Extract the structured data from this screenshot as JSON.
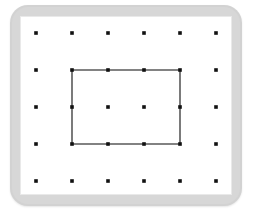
{
  "figure": {
    "name": "geoboard",
    "board": {
      "frame_color": "#d2d2d2",
      "surface_color": "#ffffff",
      "frame_corner_radius": 18,
      "frame_rect": {
        "x": 10,
        "y": 5,
        "width": 232,
        "height": 201
      },
      "surface_rect": {
        "x": 20,
        "y": 16,
        "width": 212,
        "height": 179
      }
    },
    "peg_grid": {
      "columns": 6,
      "rows": 5,
      "total_pegs": 30,
      "peg_color": "#111111",
      "peg_size": 3.6,
      "origin_x": 36,
      "origin_y": 33,
      "spacing_x": 36,
      "spacing_y": 37,
      "column_x": [
        36,
        72,
        108,
        144,
        180,
        216
      ],
      "row_y": [
        33,
        70,
        107,
        144,
        181
      ]
    },
    "shapes": [
      {
        "name": "rectangle",
        "type": "rectangle",
        "stroke_color": "#5a5a5a",
        "stroke_width": 1.6,
        "fill": "none",
        "peg_vertices": [
          {
            "col": 1,
            "row": 1
          },
          {
            "col": 4,
            "row": 1
          },
          {
            "col": 4,
            "row": 3
          },
          {
            "col": 1,
            "row": 3
          }
        ],
        "points": [
          {
            "x": 72,
            "y": 70
          },
          {
            "x": 180,
            "y": 70
          },
          {
            "x": 180,
            "y": 144
          },
          {
            "x": 72,
            "y": 144
          }
        ],
        "width_units": 3,
        "height_units": 2,
        "pegs_on_boundary": 10,
        "pegs_interior": 2
      }
    ]
  }
}
